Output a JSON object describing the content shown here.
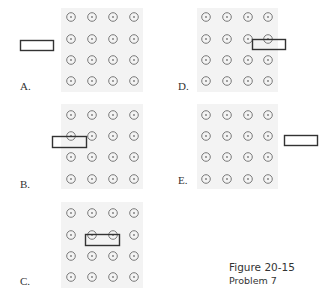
{
  "figure": {
    "title": "Figure 20-15",
    "subtitle": "Problem 7"
  },
  "panels": [
    {
      "id": "A",
      "label": "A.",
      "description": "Conducting loop located to the left, outside the magnetic field region"
    },
    {
      "id": "B",
      "label": "B.",
      "description": "Loop partially entering the field region from the left"
    },
    {
      "id": "C",
      "label": "C.",
      "description": "Loop fully inside the field region"
    },
    {
      "id": "D",
      "label": "D.",
      "description": "Loop partially leaving the field region on the right"
    },
    {
      "id": "E",
      "label": "E.",
      "description": "Loop located to the right, outside the field region"
    }
  ],
  "field": {
    "symbol": "out-of-page (dot in circle)",
    "grid": "4x4"
  },
  "colors": {
    "field_background": "#f3f3f3",
    "dot_stroke": "#7a7a7a",
    "loop_stroke": "#333333",
    "text": "#333333"
  }
}
